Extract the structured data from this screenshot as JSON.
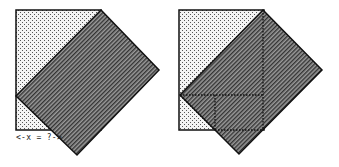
{
  "figures": {
    "left": {
      "square": {
        "x": 16,
        "y": 10,
        "w": 85,
        "h": 120
      },
      "rotated_rect": [
        [
          101,
          10
        ],
        [
          159,
          70
        ],
        [
          77,
          155
        ],
        [
          16,
          96
        ]
      ],
      "label": "<-x = ?->"
    },
    "right": {
      "square": {
        "x": 179,
        "y": 10,
        "w": 85,
        "h": 120
      },
      "rotated_rect": [
        [
          263,
          10
        ],
        [
          322,
          70
        ],
        [
          239,
          154
        ],
        [
          180,
          95
        ]
      ],
      "dotted_lines": [
        [
          [
            263,
            10
          ],
          [
            263,
            130
          ]
        ],
        [
          [
            180,
            95
          ],
          [
            263,
            95
          ]
        ],
        [
          [
            215,
            95
          ],
          [
            215,
            130
          ]
        ],
        [
          [
            215,
            130
          ],
          [
            263,
            130
          ]
        ]
      ]
    }
  },
  "colors": {
    "outline": "#111111",
    "dots_fill": "#f4f4f4",
    "dots": "#555555",
    "hatch_bg": "#8a8a8a",
    "hatch_line": "#3a3a3a"
  }
}
